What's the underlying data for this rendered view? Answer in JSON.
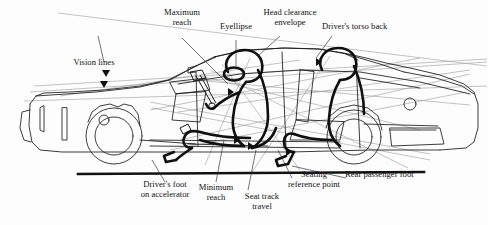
{
  "figure": {
    "background_color": "#fdfdfd",
    "line_color": "#1a1a1a",
    "thin_line_color": "#8c8c8c",
    "ground_line_color": "#111111"
  },
  "labels": {
    "vision_lines": "Vision lines",
    "maximum_reach": "Maximum\nreach",
    "eyellipse": "Eyellipse",
    "head_clearance_envelope": "Head clearance\nenvelope",
    "drivers_torso_back": "Driver's torso back",
    "drivers_foot_on_accelerator": "Driver's foot\non accelerator",
    "minimum_reach": "Minimum\nreach",
    "seat_track_travel": "Seat track\ntravel",
    "seating_reference_point": "Seating\nreference point",
    "rear_passenger_foot": "Rear passenger foot"
  }
}
